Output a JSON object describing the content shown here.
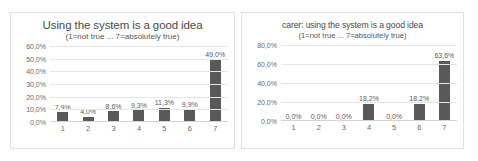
{
  "chart_data": [
    {
      "type": "bar",
      "title": "Using the system is a good idea",
      "subtitle": "(1=not true ... 7=absolutely true)",
      "xlabel": "",
      "ylabel": "",
      "categories": [
        "1",
        "2",
        "3",
        "4",
        "5",
        "6",
        "7"
      ],
      "values": [
        7.9,
        4.0,
        8.6,
        9.3,
        11.3,
        9.9,
        49.0
      ],
      "data_labels": [
        "7,9%",
        "4,0%",
        "8,6%",
        "9,3%",
        "11,3%",
        "9,9%",
        "49,0%"
      ],
      "ylim": [
        0,
        60
      ],
      "ytick_values": [
        60.0,
        50.0,
        40.0,
        30.0,
        20.0,
        10.0,
        0.0
      ],
      "ytick_labels": [
        "60,0%",
        "50,0%",
        "40,0%",
        "30,0%",
        "20,0%",
        "10,0%",
        "0,0%"
      ],
      "grid": true,
      "legend": "none",
      "bar_color": "#595959"
    },
    {
      "type": "bar",
      "title": "carer: using the system is a good idea",
      "subtitle": "(1=not true ... 7=absolutely true)",
      "xlabel": "",
      "ylabel": "",
      "categories": [
        "1",
        "2",
        "3",
        "4",
        "5",
        "6",
        "7"
      ],
      "values": [
        0.0,
        0.0,
        0.0,
        18.2,
        0.0,
        18.2,
        63.6
      ],
      "data_labels": [
        "0,0%",
        "0,0%",
        "0,0%",
        "18,2%",
        "0,0%",
        "18,2%",
        "63,6%"
      ],
      "ylim": [
        0,
        80
      ],
      "ytick_values": [
        80.0,
        60.0,
        40.0,
        20.0,
        0.0
      ],
      "ytick_labels": [
        "80,0%",
        "60,0%",
        "40,0%",
        "20,0%",
        "0,0%"
      ],
      "grid": true,
      "legend": "none",
      "bar_color": "#595959"
    }
  ]
}
